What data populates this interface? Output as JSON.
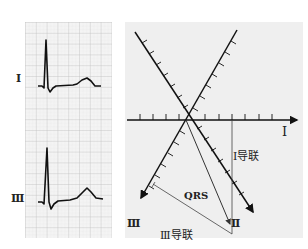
{
  "ecg_strip": {
    "grid_color": "#c9c9c9",
    "bg_color": "#f3f3f3",
    "trace_color": "#111111",
    "leads": [
      {
        "label": "Ⅰ",
        "description": "Lead I: tall R wave, small S, upright T wave"
      },
      {
        "label": "Ⅲ",
        "description": "Lead III: taller R wave, small S, upright T wave"
      }
    ]
  },
  "axis_diagram": {
    "bg_color": "#efefef",
    "axes": [
      {
        "label": "Ⅰ",
        "angle_deg": 0
      },
      {
        "label": "Ⅱ",
        "angle_deg": 60
      },
      {
        "label": "Ⅲ",
        "angle_deg": 120
      }
    ],
    "vector_label": "QRS",
    "projection_labels": {
      "lead_I": "Ⅰ导联",
      "lead_III": "Ⅲ导联"
    }
  }
}
